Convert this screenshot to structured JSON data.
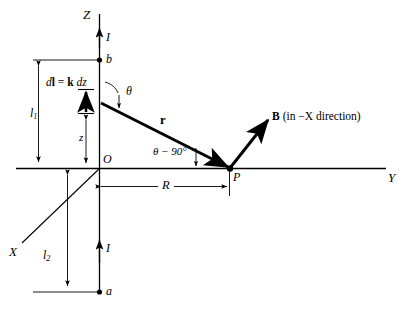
{
  "figure": {
    "kind": "physics-vector-diagram",
    "background_color": "#ffffff",
    "line_color": "#000000"
  },
  "axes": {
    "z_label": "Z",
    "y_label": "Y",
    "x_label": "X",
    "origin_label": "O"
  },
  "points": {
    "b_label": "b",
    "a_label": "a",
    "p_label": "P"
  },
  "currents": {
    "upper_label": "I",
    "lower_label": "I"
  },
  "vectors": {
    "dl_label_dl": "d",
    "dl_label_bold_l": "l",
    "dl_label_eq": " = ",
    "dl_label_bold_k": "k",
    "dl_label_dz": " dz",
    "dl_full": "dl = k dz",
    "r_label": "r",
    "b_label": "B",
    "b_note": "(in −X direction)"
  },
  "angles": {
    "theta": "θ",
    "theta_minus_90": "θ − 90°"
  },
  "dimensions": {
    "l1": "l",
    "l1_sub": "1",
    "l2": "l",
    "l2_sub": "2",
    "z": "z",
    "R": "R"
  }
}
